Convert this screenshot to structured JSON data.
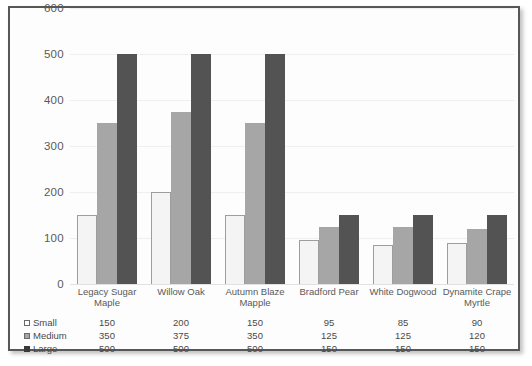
{
  "chart_data": {
    "type": "bar",
    "title": "",
    "xlabel": "",
    "ylabel": "",
    "ylim": [
      0,
      600
    ],
    "grid": true,
    "legend_position": "bottom-left-table",
    "categories": [
      "Legacy Sugar Maple",
      "Willow Oak",
      "Autumn Blaze Mapple",
      "Bradford Pear",
      "White Dogwood",
      "Dynamite Crape Myrtle"
    ],
    "y_ticks": [
      600,
      500,
      400,
      300,
      200,
      100,
      0
    ],
    "series": [
      {
        "name": "Small",
        "color": "#f4f4f4",
        "values": [
          150,
          200,
          150,
          95,
          85,
          90
        ]
      },
      {
        "name": "Medium",
        "color": "#a6a6a6",
        "values": [
          350,
          375,
          350,
          125,
          125,
          120
        ]
      },
      {
        "name": "Large",
        "color": "#535353",
        "values": [
          500,
          500,
          500,
          150,
          150,
          150
        ]
      }
    ]
  },
  "table": {
    "column_headers": [
      "Legacy Sugar Maple",
      "Willow Oak",
      "Autumn Blaze Mapple",
      "Bradford Pear",
      "White Dogwood",
      "Dynamite Crape Myrtle"
    ],
    "rows": [
      {
        "label": "Small",
        "values": [
          "150",
          "200",
          "150",
          "95",
          "85",
          "90"
        ]
      },
      {
        "label": "Medium",
        "values": [
          "350",
          "375",
          "350",
          "125",
          "125",
          "120"
        ]
      },
      {
        "label": "Large",
        "values": [
          "500",
          "500",
          "500",
          "150",
          "150",
          "150"
        ]
      }
    ]
  },
  "axis": {
    "y_tick_labels": [
      "600",
      "500",
      "400",
      "300",
      "200",
      "100",
      "0"
    ]
  },
  "colors": {
    "border": "#575757",
    "plot_background": "#fdfdfd",
    "gridline": "#efefef",
    "small": "#f4f4f4",
    "medium": "#a6a6a6",
    "large": "#535353",
    "text": "#5a5a5a"
  }
}
